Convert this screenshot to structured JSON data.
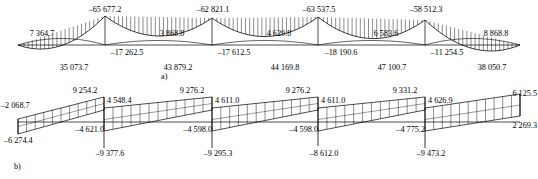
{
  "figure": {
    "type": "structural-analysis-diagrams",
    "panels": [
      {
        "tag": "a)",
        "kind": "bending-moment-diagram",
        "hatch": "vertical-ordinate-hatching"
      },
      {
        "tag": "b)",
        "kind": "shear-force-diagram",
        "hatch": "vertical-ordinate-hatching"
      }
    ]
  },
  "chart_data": [
    {
      "type": "line",
      "name": "moment-diagram-a",
      "title": "a)",
      "xlabel": "",
      "ylabel": "",
      "grid": false,
      "legend": null,
      "spans": 5,
      "support_x": [
        18,
        105,
        212,
        318,
        425,
        520
      ],
      "baseline_y": 45,
      "annotations": [
        {
          "id": "span1-sagging",
          "text": "35 073.7",
          "value": 35073.7,
          "sign": "positive",
          "position": "below-baseline",
          "span": 1,
          "x": 74,
          "y": 68
        },
        {
          "id": "span1-left-end",
          "text": "7 364.7",
          "value": 7364.7,
          "sign": "positive",
          "position": "above-baseline",
          "span": 1,
          "x": 42,
          "y": 33
        },
        {
          "id": "support2-peak",
          "text": "–65 677.2",
          "value": -65677.2,
          "sign": "negative",
          "position": "above-peak",
          "support": 2,
          "x": 105,
          "y": 10
        },
        {
          "id": "support2-inner",
          "text": "–17 262.5",
          "value": -17262.5,
          "sign": "negative",
          "position": "below-baseline",
          "support": 2,
          "x": 127,
          "y": 52
        },
        {
          "id": "span2-sagging",
          "text": "43 879.2",
          "value": 43879.2,
          "sign": "positive",
          "position": "below-baseline",
          "span": 2,
          "x": 178,
          "y": 68
        },
        {
          "id": "span2-mid",
          "text": "3 868.8",
          "value": 3868.8,
          "sign": "positive",
          "position": "above-baseline",
          "span": 2,
          "x": 172,
          "y": 33
        },
        {
          "id": "support3-peak",
          "text": "–62 821.1",
          "value": -62821.1,
          "sign": "negative",
          "position": "above-peak",
          "support": 3,
          "x": 212,
          "y": 10
        },
        {
          "id": "support3-inner",
          "text": "–17 612.5",
          "value": -17612.5,
          "sign": "negative",
          "position": "below-baseline",
          "support": 3,
          "x": 234,
          "y": 52
        },
        {
          "id": "span3-sagging",
          "text": "44 169.8",
          "value": 44169.8,
          "sign": "positive",
          "position": "below-baseline",
          "span": 3,
          "x": 285,
          "y": 68
        },
        {
          "id": "span3-mid",
          "text": "4 629.8",
          "value": 4629.8,
          "sign": "positive",
          "position": "above-baseline",
          "span": 3,
          "x": 278,
          "y": 33
        },
        {
          "id": "support4-peak",
          "text": "–63 537.5",
          "value": -63537.5,
          "sign": "negative",
          "position": "above-peak",
          "support": 4,
          "x": 318,
          "y": 10
        },
        {
          "id": "support4-inner",
          "text": "–18 190.6",
          "value": -18190.6,
          "sign": "negative",
          "position": "below-baseline",
          "support": 4,
          "x": 340,
          "y": 52
        },
        {
          "id": "span4-sagging",
          "text": "47 100.7",
          "value": 47100.7,
          "sign": "positive",
          "position": "below-baseline",
          "span": 4,
          "x": 391,
          "y": 68
        },
        {
          "id": "span4-mid",
          "text": "6 583.6",
          "value": 6583.6,
          "sign": "positive",
          "position": "above-baseline",
          "span": 4,
          "x": 385,
          "y": 33
        },
        {
          "id": "support5-peak",
          "text": "–58 512.3",
          "value": -58512.3,
          "sign": "negative",
          "position": "above-peak",
          "support": 5,
          "x": 425,
          "y": 10
        },
        {
          "id": "support5-inner",
          "text": "–11 254.5",
          "value": -11254.5,
          "sign": "negative",
          "position": "below-baseline",
          "support": 5,
          "x": 447,
          "y": 52
        },
        {
          "id": "span5-sagging",
          "text": "38 050.7",
          "value": 38050.7,
          "sign": "positive",
          "position": "below-baseline",
          "span": 5,
          "x": 491,
          "y": 68
        },
        {
          "id": "span5-right-end",
          "text": "8 868.8",
          "value": 8868.8,
          "sign": "positive",
          "position": "above-baseline",
          "span": 5,
          "x": 495,
          "y": 33
        }
      ]
    },
    {
      "type": "line",
      "name": "shear-diagram-b",
      "title": "b)",
      "xlabel": "",
      "ylabel": "",
      "grid": false,
      "legend": null,
      "spans": 5,
      "support_x": [
        18,
        104,
        212,
        318,
        425,
        520
      ],
      "baseline_y": 122,
      "annotations": [
        {
          "id": "b-span1-left-top",
          "text": "–2 068.7",
          "value": -2068.7,
          "sign": "negative",
          "position": "left-upper",
          "span": 1,
          "x": 2,
          "y": 104
        },
        {
          "id": "b-span1-left-bottom",
          "text": "–6 274.4",
          "value": -6274.4,
          "sign": "negative",
          "position": "left-lower",
          "span": 1,
          "x": 6,
          "y": 139
        },
        {
          "id": "b-support2-above",
          "text": "9 254.2",
          "value": 9254.2,
          "sign": "positive",
          "position": "above-support",
          "support": 2,
          "x": 84,
          "y": 88
        },
        {
          "id": "b-support2-right-top",
          "text": "4 548.4",
          "value": 4548.4,
          "sign": "positive",
          "position": "right-upper",
          "support": 2,
          "x": 107,
          "y": 99
        },
        {
          "id": "b-support2-left-low",
          "text": "–4 621.0",
          "value": -4621.0,
          "sign": "negative",
          "position": "left-lower",
          "support": 2,
          "x": 100,
          "y": 128
        },
        {
          "id": "b-support2-below",
          "text": "–9 377.6",
          "value": -9377.6,
          "sign": "negative",
          "position": "below-support",
          "support": 2,
          "x": 108,
          "y": 152
        },
        {
          "id": "b-support3-above",
          "text": "9 276.2",
          "value": 9276.2,
          "sign": "positive",
          "position": "above-support",
          "support": 3,
          "x": 191,
          "y": 88
        },
        {
          "id": "b-support3-right-top",
          "text": "4 611.0",
          "value": 4611.0,
          "sign": "positive",
          "position": "right-upper",
          "support": 3,
          "x": 215,
          "y": 99
        },
        {
          "id": "b-support3-left-low",
          "text": "–4 598.0",
          "value": -4598.0,
          "sign": "negative",
          "position": "left-lower",
          "support": 3,
          "x": 207,
          "y": 128
        },
        {
          "id": "b-support3-below",
          "text": "–9 295.3",
          "value": -9295.3,
          "sign": "negative",
          "position": "below-support",
          "support": 3,
          "x": 216,
          "y": 152
        },
        {
          "id": "b-support4-above",
          "text": "9 276.2",
          "value": 9276.2,
          "sign": "positive",
          "position": "above-support",
          "support": 4,
          "x": 297,
          "y": 88
        },
        {
          "id": "b-support4-right-top",
          "text": "4 611.0",
          "value": 4611.0,
          "sign": "positive",
          "position": "right-upper",
          "support": 4,
          "x": 321,
          "y": 99
        },
        {
          "id": "b-support4-left-low",
          "text": "–4 598.0",
          "value": -4598.0,
          "sign": "negative",
          "position": "left-lower",
          "support": 4,
          "x": 313,
          "y": 128
        },
        {
          "id": "b-support4-below",
          "text": "–8 612.0",
          "value": -8612.0,
          "sign": "negative",
          "position": "below-support",
          "support": 4,
          "x": 322,
          "y": 152
        },
        {
          "id": "b-support5-above",
          "text": "9 331.2",
          "value": 9331.2,
          "sign": "positive",
          "position": "above-support",
          "support": 5,
          "x": 404,
          "y": 88
        },
        {
          "id": "b-support5-right-top",
          "text": "4 626.9",
          "value": 4626.9,
          "sign": "positive",
          "position": "right-upper",
          "support": 5,
          "x": 428,
          "y": 99
        },
        {
          "id": "b-support5-left-low",
          "text": "–4 775.2",
          "value": -4775.2,
          "sign": "negative",
          "position": "left-lower",
          "support": 5,
          "x": 420,
          "y": 128
        },
        {
          "id": "b-support5-below",
          "text": "–9 473.2",
          "value": -9473.2,
          "sign": "negative",
          "position": "below-support",
          "support": 5,
          "x": 429,
          "y": 152
        },
        {
          "id": "b-right-end-top",
          "text": "6 125.5",
          "value": 6125.5,
          "sign": "positive",
          "position": "right-upper",
          "span": 5,
          "x": 536,
          "y": 92
        },
        {
          "id": "b-right-end-bottom",
          "text": "2 269.3",
          "value": 2269.3,
          "sign": "positive",
          "position": "right-lower",
          "span": 5,
          "x": 536,
          "y": 124
        }
      ]
    }
  ],
  "labels": {
    "a": {
      "tag": "a)",
      "span1_sag": "35 073.7",
      "span1_left": "7 364.7",
      "sup2_peak": "–65 677.2",
      "sup2_inner": "–17 262.5",
      "span2_sag": "43 879.2",
      "span2_mid": "3 868.8",
      "sup3_peak": "–62 821.1",
      "sup3_inner": "–17 612.5",
      "span3_sag": "44 169.8",
      "span3_mid": "4 629.8",
      "sup4_peak": "–63 537.5",
      "sup4_inner": "–18 190.6",
      "span4_sag": "47 100.7",
      "span4_mid": "6 583.6",
      "sup5_peak": "–58 512.3",
      "sup5_inner": "–11 254.5",
      "span5_sag": "38 050.7",
      "span5_right": "8 868.8"
    },
    "b": {
      "tag": "b)",
      "left_top": "–2 068.7",
      "left_bottom": "–6 274.4",
      "s2_above": "9 254.2",
      "s2_right": "4 548.4",
      "s2_left_low": "–4 621.0",
      "s2_below": "–9 377.6",
      "s3_above": "9 276.2",
      "s3_right": "4 611.0",
      "s3_left_low": "–4 598.0",
      "s3_below": "–9 295.3",
      "s4_above": "9 276.2",
      "s4_right": "4 611.0",
      "s4_left_low": "–4 598.0",
      "s4_below": "–8 612.0",
      "s5_above": "9 331.2",
      "s5_right": "4 626.9",
      "s5_left_low": "–4 775.2",
      "s5_below": "–9 473.2",
      "right_top": "6 125.5",
      "right_bottom": "2 269.3"
    }
  },
  "colors": {
    "line": "#000000",
    "background": "#ffffff"
  }
}
